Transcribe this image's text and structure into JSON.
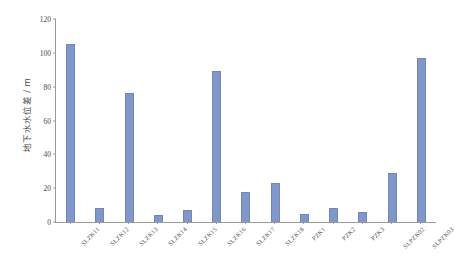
{
  "chart_data": {
    "type": "bar",
    "title": "",
    "xlabel": "",
    "ylabel": "地下水水位差 / m",
    "ylim": [
      0,
      120
    ],
    "yticks": [
      0,
      20,
      40,
      60,
      80,
      100,
      120
    ],
    "grid": false,
    "legend": null,
    "bar_color": "#8196c9",
    "axis_color": "#9a9a9a",
    "categories": [
      "SLZK11",
      "SLZK12",
      "SLZK13",
      "SLZK14",
      "SLZK15",
      "SLZK16",
      "SLZK17",
      "SLZK18",
      "PZK1",
      "PZK2",
      "PZK3",
      "SLPZK02",
      "SLPZK03"
    ],
    "values": [
      105,
      8,
      76,
      4,
      7,
      89,
      18,
      23,
      5,
      8,
      6,
      29,
      97
    ]
  }
}
